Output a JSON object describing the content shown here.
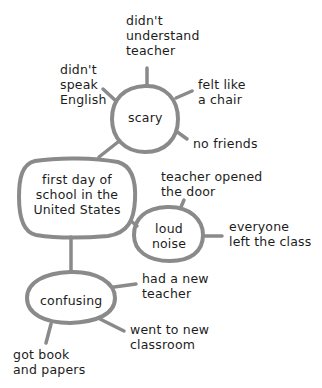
{
  "diagram": {
    "type": "idea web",
    "colors": {
      "stroke": "#8a8a8a",
      "text": "#1c1c1c",
      "background": "#ffffff"
    },
    "center": {
      "label": "first day of\nschool in the\nUnited States"
    },
    "branches": [
      {
        "label": "scary",
        "details": [
          {
            "label": "didn't\nunderstand\nteacher"
          },
          {
            "label": "didn't\nspeak\nEnglish"
          },
          {
            "label": "felt like\na chair"
          },
          {
            "label": "no friends"
          }
        ]
      },
      {
        "label": "loud\nnoise",
        "details": [
          {
            "label": "teacher opened\nthe door"
          },
          {
            "label": "everyone\nleft the class"
          }
        ]
      },
      {
        "label": "confusing",
        "details": [
          {
            "label": "had a new\nteacher"
          },
          {
            "label": "went to new\nclassroom"
          },
          {
            "label": "got book\nand papers"
          }
        ]
      }
    ]
  }
}
